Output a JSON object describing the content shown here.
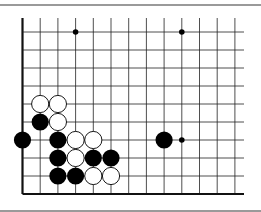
{
  "diagram": {
    "type": "go-board-fragment",
    "columns": 13,
    "rows": 10,
    "origin": {
      "x": 22.5,
      "y": 32
    },
    "spacing": {
      "x": 17.7,
      "y": 18
    },
    "line_extent_right": 244,
    "edges": [
      "left",
      "bottom"
    ],
    "colors": {
      "line": "#222222",
      "edge": "#111111",
      "black": "#000000",
      "white": "#ffffff",
      "rule": "#9a9a9a"
    },
    "star_points": [
      {
        "col": 3,
        "row": 0
      },
      {
        "col": 9,
        "row": 0
      },
      {
        "col": 9,
        "row": 6
      }
    ],
    "stones": [
      {
        "col": 1,
        "row": 4,
        "color": "white"
      },
      {
        "col": 2,
        "row": 4,
        "color": "white"
      },
      {
        "col": 1,
        "row": 5,
        "color": "black"
      },
      {
        "col": 2,
        "row": 5,
        "color": "white"
      },
      {
        "col": 0,
        "row": 6,
        "color": "black"
      },
      {
        "col": 2,
        "row": 6,
        "color": "black"
      },
      {
        "col": 3,
        "row": 6,
        "color": "white"
      },
      {
        "col": 4,
        "row": 6,
        "color": "white"
      },
      {
        "col": 8,
        "row": 6,
        "color": "black"
      },
      {
        "col": 2,
        "row": 7,
        "color": "black"
      },
      {
        "col": 3,
        "row": 7,
        "color": "white"
      },
      {
        "col": 4,
        "row": 7,
        "color": "black"
      },
      {
        "col": 5,
        "row": 7,
        "color": "black"
      },
      {
        "col": 2,
        "row": 8,
        "color": "black"
      },
      {
        "col": 3,
        "row": 8,
        "color": "black"
      },
      {
        "col": 4,
        "row": 8,
        "color": "white"
      },
      {
        "col": 5,
        "row": 8,
        "color": "white"
      }
    ]
  }
}
